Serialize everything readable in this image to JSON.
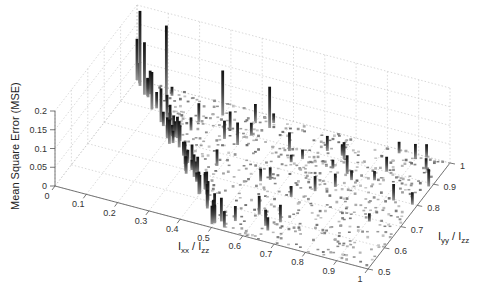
{
  "chart_data": {
    "type": "bar3",
    "title": "",
    "xlabel": "I_xx / I_zz",
    "ylabel": "I_yy / I_zz",
    "zlabel": "Mean Square Error (MSE)",
    "xlim": [
      0,
      1
    ],
    "ylim": [
      0.5,
      1
    ],
    "zlim": [
      0,
      0.2
    ],
    "x_ticks": [
      "0",
      "0.1",
      "0.2",
      "0.3",
      "0.4",
      "0.5",
      "0.6",
      "0.7",
      "0.8",
      "0.9",
      "1"
    ],
    "y_ticks": [
      "0.5",
      "0.6",
      "0.7",
      "0.8",
      "0.9",
      "1"
    ],
    "z_ticks": [
      "0",
      "0.05",
      "0.1",
      "0.15",
      "0.2"
    ],
    "grid": true,
    "colormap": "gray",
    "domain_note": "Points lie in triangular region where Ixx/Izz + Iyy/Izz >= 1 (i.e. Iyy/Izz >= 1 - Ixx/Izz), Ixx<=1, Iyy<=1",
    "highlights": [
      {
        "x": 0.02,
        "y": 0.98,
        "z": 0.2
      },
      {
        "x": 0.0,
        "y": 1.0,
        "z": 0.11
      },
      {
        "x": 0.05,
        "y": 0.95,
        "z": 0.14
      },
      {
        "x": 0.12,
        "y": 0.95,
        "z": 0.2
      },
      {
        "x": 0.3,
        "y": 0.95,
        "z": 0.12
      },
      {
        "x": 0.45,
        "y": 0.95,
        "z": 0.11
      },
      {
        "x": 0.1,
        "y": 0.9,
        "z": 0.1
      },
      {
        "x": 0.15,
        "y": 0.86,
        "z": 0.09
      },
      {
        "x": 0.2,
        "y": 0.82,
        "z": 0.08
      },
      {
        "x": 0.25,
        "y": 0.78,
        "z": 0.07
      },
      {
        "x": 0.3,
        "y": 0.72,
        "z": 0.06
      },
      {
        "x": 0.35,
        "y": 0.68,
        "z": 0.06
      },
      {
        "x": 0.4,
        "y": 0.62,
        "z": 0.05
      },
      {
        "x": 0.45,
        "y": 0.57,
        "z": 0.05
      },
      {
        "x": 0.5,
        "y": 0.52,
        "z": 0.05
      },
      {
        "x": 0.48,
        "y": 0.55,
        "z": 0.04
      },
      {
        "x": 0.55,
        "y": 0.55,
        "z": 0.04
      },
      {
        "x": 0.6,
        "y": 0.6,
        "z": 0.05
      },
      {
        "x": 0.7,
        "y": 0.75,
        "z": 0.04
      },
      {
        "x": 0.75,
        "y": 0.85,
        "z": 0.05
      },
      {
        "x": 0.85,
        "y": 0.9,
        "z": 0.04
      },
      {
        "x": 0.95,
        "y": 0.95,
        "z": 0.03
      },
      {
        "x": 0.9,
        "y": 0.98,
        "z": 0.04
      },
      {
        "x": 0.65,
        "y": 0.92,
        "z": 0.04
      },
      {
        "x": 0.55,
        "y": 0.88,
        "z": 0.05
      },
      {
        "x": 0.4,
        "y": 0.85,
        "z": 0.06
      },
      {
        "x": 0.35,
        "y": 0.9,
        "z": 0.05
      },
      {
        "x": 0.25,
        "y": 0.9,
        "z": 0.05
      }
    ]
  },
  "figure": {
    "xlabel_main": "I",
    "xlabel_sub1": "xx",
    "xlabel_div": " / I",
    "xlabel_sub2": "zz",
    "ylabel_main": "I",
    "ylabel_sub1": "yy",
    "ylabel_div": " / I",
    "ylabel_sub2": "zz",
    "zlabel": "Mean Square Error (MSE)"
  }
}
